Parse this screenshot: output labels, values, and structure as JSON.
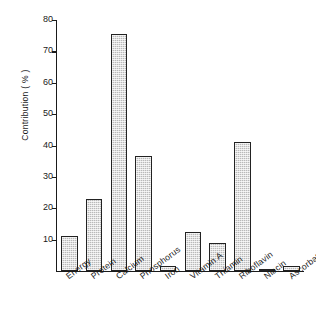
{
  "chart_data": {
    "type": "bar",
    "title": "",
    "xlabel": "",
    "ylabel": "Contribution ( % )",
    "categories": [
      "Energy",
      "Protein",
      "Calcium",
      "Phosphorus",
      "Iron",
      "Vitamin A",
      "Thiamin",
      "Riboflavin",
      "Niacin",
      "Ascorbate"
    ],
    "values": [
      11.3,
      23.0,
      75.5,
      36.8,
      1.5,
      12.3,
      8.8,
      41.0,
      0.8,
      1.5
    ],
    "ylim": [
      0,
      80
    ],
    "yticks": [
      10,
      20,
      30,
      40,
      50,
      60,
      70,
      80
    ],
    "ytick_labels": [
      "10",
      "20",
      "30",
      "40",
      "50",
      "60",
      "70",
      "80"
    ],
    "grid": false,
    "legend": "none",
    "bar_fill_color": "#b9b9b9",
    "bar_edge_color": "#222222",
    "axis_color": "#1a1a1a",
    "background_color": "#ffffff"
  }
}
